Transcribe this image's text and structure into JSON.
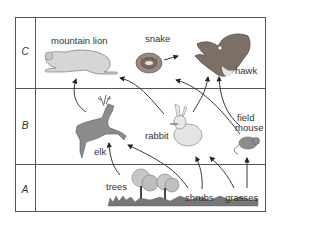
{
  "diagram": {
    "type": "food-web",
    "levels": [
      {
        "id": "C",
        "label": "C"
      },
      {
        "id": "B",
        "label": "B"
      },
      {
        "id": "A",
        "label": "A"
      }
    ],
    "organisms": {
      "mountain_lion": {
        "label": "mountain lion",
        "level": "C"
      },
      "snake": {
        "label": "snake",
        "level": "C"
      },
      "hawk": {
        "label": "hawk",
        "level": "C"
      },
      "elk": {
        "label": "elk",
        "level": "B"
      },
      "rabbit": {
        "label": "rabbit",
        "level": "B"
      },
      "field_mouse": {
        "label": "field mouse",
        "label_line1": "field",
        "label_line2": "mouse",
        "level": "B"
      },
      "trees": {
        "label": "trees",
        "level": "A"
      },
      "shrubs": {
        "label": "shrubs",
        "level": "A"
      },
      "grasses": {
        "label": "grasses",
        "level": "A"
      }
    },
    "arrows": [
      {
        "from": "elk",
        "to": "mountain lion"
      },
      {
        "from": "rabbit",
        "to": "mountain lion"
      },
      {
        "from": "field mouse",
        "to": "snake"
      },
      {
        "from": "snake",
        "to": "hawk"
      },
      {
        "from": "rabbit",
        "to": "hawk"
      },
      {
        "from": "field mouse",
        "to": "hawk"
      },
      {
        "from": "trees",
        "to": "elk"
      },
      {
        "from": "shrubs",
        "to": "elk"
      },
      {
        "from": "shrubs",
        "to": "rabbit"
      },
      {
        "from": "grasses",
        "to": "rabbit"
      },
      {
        "from": "grasses",
        "to": "field mouse"
      }
    ],
    "colors": {
      "grid": "#555555",
      "animal_fill": "#8a8a8a",
      "light_fill": "#d8d8d8",
      "arrow": "#222222",
      "text": "#333333"
    }
  }
}
